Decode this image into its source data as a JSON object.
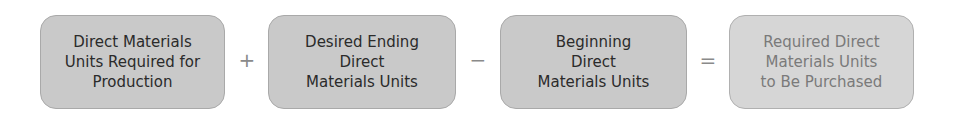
{
  "equation": {
    "terms": [
      {
        "lines": [
          "Direct Materials",
          "Units Required for",
          "Production"
        ]
      },
      {
        "lines": [
          "Desired Ending",
          "Direct",
          "Materials Units"
        ]
      },
      {
        "lines": [
          "Beginning",
          "Direct",
          "Materials Units"
        ]
      },
      {
        "lines": [
          "Required Direct",
          "Materials Units",
          "to Be Purchased"
        ]
      }
    ],
    "operators": [
      "+",
      "−",
      "="
    ]
  },
  "colors": {
    "box_fill": "#c9c9c9",
    "result_fill": "#d6d6d6",
    "text": "#2b2b2b",
    "result_text": "#7a7a7a",
    "operator": "#8a8a8a"
  }
}
